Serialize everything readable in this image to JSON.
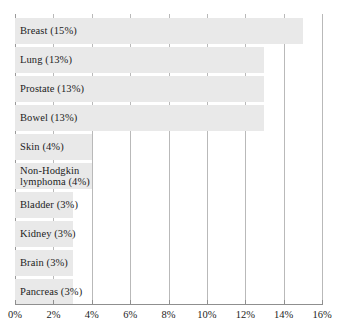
{
  "chart_data": {
    "type": "bar",
    "orientation": "horizontal",
    "title": "",
    "subtitle": "",
    "xlabel": "",
    "ylabel": "",
    "xlim": [
      0,
      16
    ],
    "xtick_step": 2,
    "xtick_labels": [
      "0%",
      "2%",
      "4%",
      "6%",
      "8%",
      "10%",
      "12%",
      "14%",
      "16%"
    ],
    "xtick_values": [
      0,
      2,
      4,
      6,
      8,
      10,
      12,
      14,
      16
    ],
    "grid": true,
    "grid_axis": "x",
    "legend": false,
    "legend_position": "none",
    "value_unit": "%",
    "categories": [
      "Breast",
      "Lung",
      "Prostate",
      "Bowel",
      "Skin",
      "Non-Hodgkin lymphoma",
      "Bladder",
      "Kidney",
      "Brain",
      "Pancreas"
    ],
    "values": [
      15,
      13,
      13,
      13,
      4,
      4,
      3,
      3,
      3,
      3
    ],
    "bars": [
      {
        "label_lines": [
          "Breast (15%)"
        ],
        "value": 15
      },
      {
        "label_lines": [
          "Lung (13%)"
        ],
        "value": 13
      },
      {
        "label_lines": [
          "Prostate (13%)"
        ],
        "value": 13
      },
      {
        "label_lines": [
          "Bowel (13%)"
        ],
        "value": 13
      },
      {
        "label_lines": [
          "Skin (4%)"
        ],
        "value": 4
      },
      {
        "label_lines": [
          "Non-Hodgkin",
          "lymphoma (4%)"
        ],
        "value": 4
      },
      {
        "label_lines": [
          "Bladder (3%)"
        ],
        "value": 3
      },
      {
        "label_lines": [
          "Kidney (3%)"
        ],
        "value": 3
      },
      {
        "label_lines": [
          "Brain (3%)"
        ],
        "value": 3
      },
      {
        "label_lines": [
          "Pancreas (3%)"
        ],
        "value": 3
      }
    ],
    "colors": {
      "bar_fill": "#e9e9e9",
      "gridline": "#b9b9b9",
      "axis": "#8f8f8f",
      "text": "#1d1d1d",
      "background": "#ffffff"
    }
  }
}
